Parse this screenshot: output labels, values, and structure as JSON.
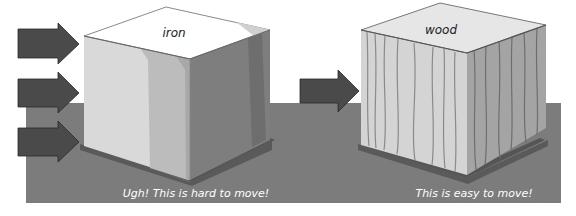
{
  "diagram": {
    "colors": {
      "floor": "#7a7a7a",
      "arrow": "#4a4a4a",
      "shadow": "#555555",
      "caption": "#ffffff"
    },
    "left": {
      "material": "iron",
      "caption": "Ugh! This is hard to move!",
      "arrow_count": 3
    },
    "right": {
      "material": "wood",
      "caption": "This is easy to move!",
      "arrow_count": 1
    }
  }
}
